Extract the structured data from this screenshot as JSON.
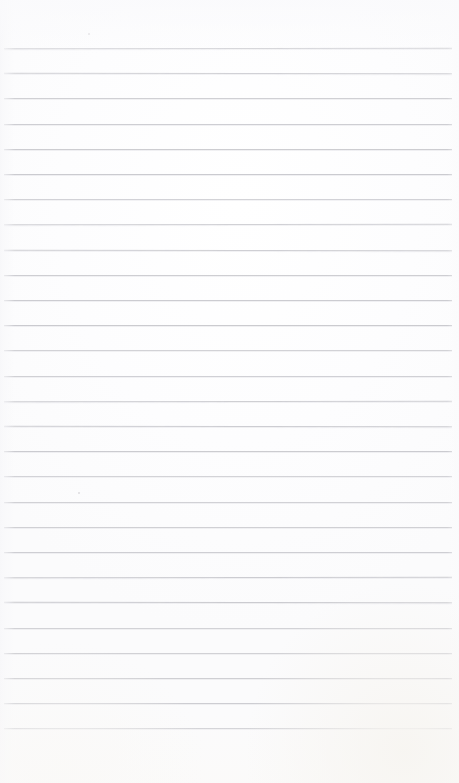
{
  "document": {
    "kind": "scanned-ruled-notepad-page",
    "title": "Blank Ruled Notepad Page",
    "orientation": "portrait",
    "page_width": 459,
    "page_height": 783,
    "has_text_content": false,
    "written_text": "",
    "paper_color": "#fdfdfd",
    "background_color": "#ffffff"
  },
  "ruling": {
    "line_color": "#c9c9ce",
    "line_thickness_px": 1,
    "line_count": 28,
    "line_spacing_px": 25.2,
    "first_line_y": 48,
    "last_line_y": 728,
    "left_x": 4,
    "right_x": 452,
    "top_margin_px": 48,
    "bottom_margin_px": 55,
    "line_y_positions": [
      48,
      73.2,
      98.4,
      123.6,
      148.8,
      174,
      199.2,
      224.4,
      249.6,
      274.8,
      300,
      325.2,
      350.4,
      375.6,
      400.8,
      426,
      451.2,
      476.4,
      501.6,
      526.8,
      552,
      577.2,
      602.4,
      627.6,
      652.8,
      678,
      703.2,
      728.4
    ]
  },
  "artifacts": {
    "specks": [
      {
        "name": "speck-top",
        "x": 88,
        "y": 33,
        "size": 2
      },
      {
        "name": "speck-mid",
        "x": 78,
        "y": 492,
        "size": 2
      }
    ]
  }
}
